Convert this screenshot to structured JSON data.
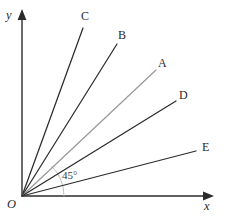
{
  "figure": {
    "background_color": "#ffffff",
    "width": 226,
    "height": 223
  },
  "axes": {
    "origin_label": "O",
    "x_label": "x",
    "y_label": "y",
    "stroke_color": "#2b2b2b",
    "origin": {
      "x": 22,
      "y": 196
    },
    "x_end": {
      "x": 212,
      "y": 196
    },
    "y_end": {
      "x": 22,
      "y": 12
    }
  },
  "angle_marker": {
    "label": "45°",
    "value": 45,
    "unit": "degrees",
    "arc_color": "#c3c3c3",
    "arc_radius": 42,
    "from_ray": "x-axis",
    "to_ray": "A"
  },
  "rays": [
    {
      "label": "C",
      "angle_deg": 70,
      "color": "#2b2b2b",
      "highlighted": false,
      "end": {
        "x": 83,
        "y": 28
      },
      "label_pos": {
        "x": 81,
        "y": 10
      }
    },
    {
      "label": "B",
      "angle_deg": 58,
      "color": "#2b2b2b",
      "highlighted": false,
      "end": {
        "x": 117,
        "y": 44
      },
      "label_pos": {
        "x": 118,
        "y": 29
      }
    },
    {
      "label": "A",
      "angle_deg": 45,
      "color": "#9a9a9a",
      "highlighted": true,
      "end": {
        "x": 156,
        "y": 70
      },
      "label_pos": {
        "x": 158,
        "y": 57
      }
    },
    {
      "label": "D",
      "angle_deg": 33.5,
      "color": "#2b2b2b",
      "highlighted": false,
      "end": {
        "x": 176,
        "y": 101
      },
      "label_pos": {
        "x": 179,
        "y": 89
      }
    },
    {
      "label": "E",
      "angle_deg": 16,
      "color": "#2b2b2b",
      "highlighted": false,
      "end": {
        "x": 196,
        "y": 151
      },
      "label_pos": {
        "x": 202,
        "y": 141
      }
    }
  ],
  "labels": {
    "origin": "O",
    "x_axis": "x",
    "y_axis": "y",
    "angle": "45°",
    "ray_a": "A",
    "ray_b": "B",
    "ray_c": "C",
    "ray_d": "D",
    "ray_e": "E"
  }
}
